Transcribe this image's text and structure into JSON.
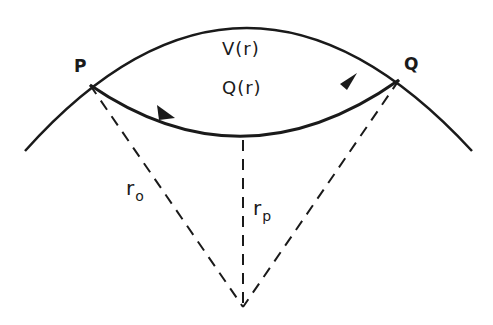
{
  "diagram": {
    "title": "",
    "points": {
      "P": {
        "label": "P",
        "x": 90,
        "y": 85
      },
      "Q": {
        "label": "Q",
        "x": 399,
        "y": 80
      },
      "center": {
        "x": 243,
        "y": 307
      },
      "periapsis": {
        "x": 243,
        "y": 138
      }
    },
    "labels": {
      "potential": "V(r)",
      "q_function": "Q(r)",
      "r_o_base": "r",
      "r_o_sub": "o",
      "r_p_base": "r",
      "r_p_sub": "p"
    },
    "colors": {
      "stroke": "#1a1a1a",
      "background": "#ffffff"
    }
  }
}
